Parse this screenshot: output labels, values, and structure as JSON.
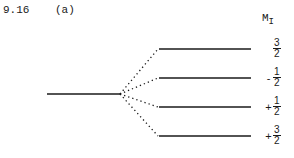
{
  "problem": {
    "number": "9.16",
    "part": "(a)"
  },
  "header": {
    "symbol": "M",
    "subscript": "I"
  },
  "levels": [
    {
      "sign": "",
      "numerator": "3",
      "denominator": "2",
      "y": 49
    },
    {
      "sign": "-",
      "numerator": "1",
      "denominator": "2",
      "y": 78
    },
    {
      "sign": "+",
      "numerator": "1",
      "denominator": "2",
      "y": 107
    },
    {
      "sign": "+",
      "numerator": "3",
      "denominator": "2",
      "y": 136
    }
  ],
  "colors": {
    "line": "#1a1a1a"
  }
}
